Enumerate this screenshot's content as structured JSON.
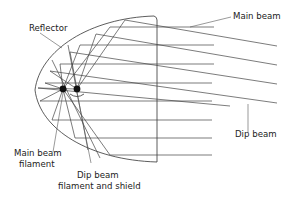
{
  "diagram": {
    "labels": {
      "reflector": "Reflector",
      "main_beam": "Main beam",
      "dip_beam": "Dip beam",
      "main_beam_filament_line1": "Main beam",
      "main_beam_filament_line2": "filament",
      "dip_beam_filament_line1": "Dip beam",
      "dip_beam_filament_line2": "filament and shield"
    },
    "colors": {
      "line": "#333333",
      "text": "#222222",
      "background": "#ffffff"
    }
  }
}
